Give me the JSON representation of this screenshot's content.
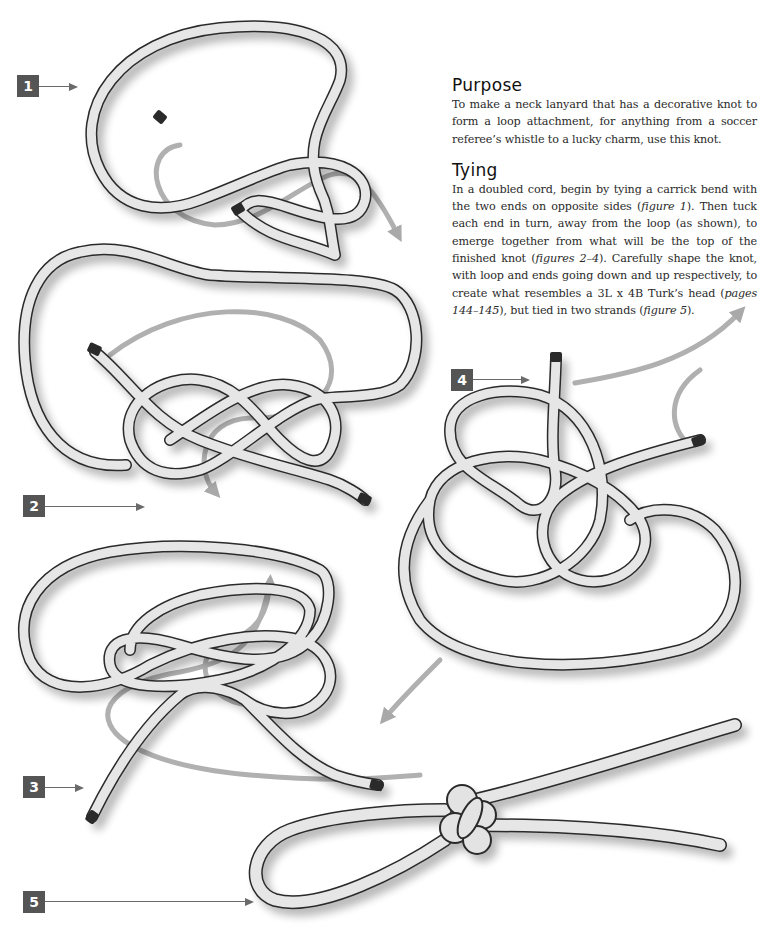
{
  "purpose": {
    "heading": "Purpose",
    "body": "To make a neck lanyard that has a decorative knot to form a loop attachment, for anything from a soccer referee’s whistle to a lucky charm, use this knot."
  },
  "tying": {
    "heading": "Tying",
    "segments": [
      {
        "text": "In a doubled cord, begin by tying a carrick bend with the two ends on opposite sides (",
        "italic": false
      },
      {
        "text": "figure 1",
        "italic": true
      },
      {
        "text": "). Then tuck each end in turn, away from the loop (as shown), to emerge together from what will be the top of the finished knot (",
        "italic": false
      },
      {
        "text": "figures 2–4",
        "italic": true
      },
      {
        "text": "). Carefully shape the knot, with loop and ends going down and up respectively, to create what resembles a 3L x 4B Turk’s head (",
        "italic": false
      },
      {
        "text": "pages 144–145",
        "italic": true
      },
      {
        "text": "), but tied in two strands (",
        "italic": false
      },
      {
        "text": "figure 5",
        "italic": true
      },
      {
        "text": ").",
        "italic": false
      }
    ]
  },
  "figures": [
    {
      "number": "1",
      "description": "Carrick bend with ends on opposite sides"
    },
    {
      "number": "2",
      "description": "Tucking first end away from loop"
    },
    {
      "number": "3",
      "description": "Tucking second end away from loop"
    },
    {
      "number": "4",
      "description": "Both ends emerge together at top"
    },
    {
      "number": "5",
      "description": "Finished lanyard knot with loop and ends"
    }
  ],
  "colors": {
    "label_bg": "#555555",
    "label_text": "#ffffff",
    "rope_fill": "#e4e4e4",
    "rope_outline": "#2a2a2a",
    "guide_arrow": "#a9a9a9",
    "pointer_line": "#6a6a6a"
  }
}
